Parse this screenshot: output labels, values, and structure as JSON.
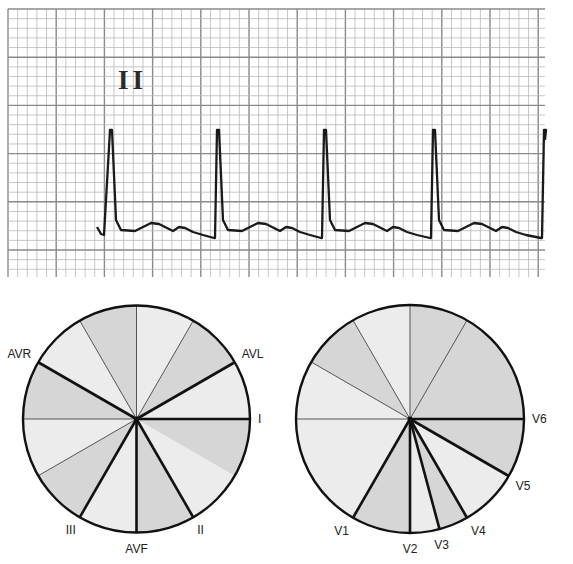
{
  "ecg_strip": {
    "lead_label": "II",
    "grid": {
      "x0": 8,
      "y0": 9,
      "x1": 545,
      "y1": 277,
      "major_spacing": 48.2,
      "minor_per_major": 5,
      "major_color": "#8a8a8a",
      "minor_color": "#b8b8b8"
    },
    "trace_color": "#1a1a1a",
    "beats_r_peak_x": [
      111,
      218,
      325,
      434,
      545
    ],
    "baseline_y": 230,
    "r_peak_y": 130
  },
  "frontal_plane_diagram": {
    "name": "Hexaxial reference (limb leads)",
    "center": [
      136.5,
      419
    ],
    "radius": 113.5,
    "leads": [
      {
        "label": "I",
        "angle_deg": 0
      },
      {
        "label": "II",
        "angle_deg": 60
      },
      {
        "label": "AVF",
        "angle_deg": 90
      },
      {
        "label": "III",
        "angle_deg": 120
      },
      {
        "label": "AVR",
        "angle_deg": -150
      },
      {
        "label": "AVL",
        "angle_deg": -30
      }
    ],
    "thin_spokes_deg": [
      -90,
      -60,
      -120,
      180,
      150
    ],
    "shaded_sectors": [
      [
        0,
        30
      ],
      [
        60,
        90
      ],
      [
        120,
        150
      ],
      [
        -180,
        -150
      ],
      [
        -120,
        -90
      ],
      [
        -60,
        -30
      ]
    ]
  },
  "horizontal_plane_diagram": {
    "name": "Precordial leads",
    "center": [
      410,
      419
    ],
    "radius": 114,
    "leads": [
      {
        "label": "V1",
        "angle_deg": 120
      },
      {
        "label": "V2",
        "angle_deg": 90
      },
      {
        "label": "V3",
        "angle_deg": 75
      },
      {
        "label": "V4",
        "angle_deg": 60
      },
      {
        "label": "V5",
        "angle_deg": 30
      },
      {
        "label": "V6",
        "angle_deg": 0
      }
    ],
    "thin_spokes_deg": [
      -90,
      -60,
      -120,
      -150,
      180
    ],
    "shaded_sectors": [
      [
        0,
        30
      ],
      [
        60,
        75
      ],
      [
        90,
        120
      ],
      [
        -150,
        -120
      ],
      [
        -90,
        -60
      ],
      [
        -60,
        0
      ]
    ]
  },
  "colors": {
    "sector_light": "#ececec",
    "sector_dark": "#d6d6d6",
    "outline": "#111111"
  }
}
